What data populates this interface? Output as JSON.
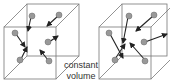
{
  "diagram": {
    "caption_line1": "constant",
    "caption_line2": "volume",
    "colors": {
      "cube_edge": "#666666",
      "particle": "#8a8a8a",
      "arrow": "#222222",
      "text": "#333333"
    },
    "left_cube": {
      "description": "gas particles with velocity arrows at lower temperature",
      "particles": 6
    },
    "right_cube": {
      "description": "gas particles with longer velocity arrows at higher temperature",
      "particles": 6
    }
  }
}
